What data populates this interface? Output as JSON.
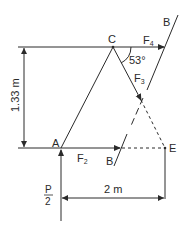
{
  "diagram": {
    "type": "truss-free-body",
    "points": {
      "C": "C",
      "A": "A",
      "E": "E",
      "B_top": "B",
      "B_bottom": "B"
    },
    "forces": {
      "f4": "F",
      "f4_sub": "4",
      "f3": "F",
      "f3_sub": "3",
      "f2": "F",
      "f2_sub": "2",
      "load_num": "P",
      "load_den": "2"
    },
    "angle": "53°",
    "dimensions": {
      "height": "1.33 m",
      "width": "2 m"
    },
    "colors": {
      "line": "#2a2a2a",
      "background": "#ffffff"
    }
  }
}
